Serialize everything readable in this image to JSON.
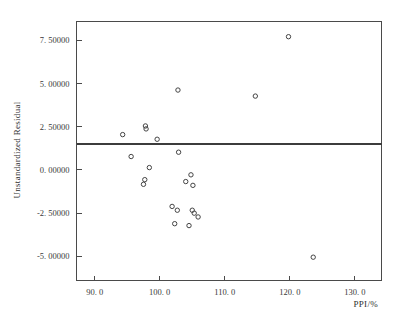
{
  "chart_data": {
    "type": "scatter",
    "title": "",
    "xlabel": "PPI/%",
    "ylabel": "Unstandardized Residual",
    "xlim": [
      87.2,
      134.1
    ],
    "ylim": [
      -6.4,
      8.6
    ],
    "grid": false,
    "legend": null,
    "marker": "open-circle",
    "xticks": [
      90.0,
      100.0,
      110.0,
      120.0,
      130.0
    ],
    "xtick_labels": [
      "90. 0",
      "100. 0",
      "110. 0",
      "120. 0",
      "130. 0"
    ],
    "yticks": [
      -5.0,
      -2.5,
      0.0,
      2.5,
      5.0,
      7.5
    ],
    "ytick_labels": [
      "-5. 00000",
      "-2. 50000",
      "0. 00000",
      "2. 50000",
      "5. 00000",
      "7. 50000"
    ],
    "reference_line": {
      "orientation": "horizontal",
      "y": 1.5
    },
    "points": [
      {
        "x": 94.3,
        "y": 2.05
      },
      {
        "x": 97.8,
        "y": 2.55
      },
      {
        "x": 97.9,
        "y": 2.38
      },
      {
        "x": 99.6,
        "y": 1.78
      },
      {
        "x": 95.6,
        "y": 0.78
      },
      {
        "x": 98.4,
        "y": 0.14
      },
      {
        "x": 97.7,
        "y": -0.56
      },
      {
        "x": 97.5,
        "y": -0.83
      },
      {
        "x": 102.8,
        "y": 4.63
      },
      {
        "x": 102.9,
        "y": 1.03
      },
      {
        "x": 104.8,
        "y": -0.28
      },
      {
        "x": 104.0,
        "y": -0.67
      },
      {
        "x": 105.1,
        "y": -0.89
      },
      {
        "x": 101.9,
        "y": -2.11
      },
      {
        "x": 102.7,
        "y": -2.33
      },
      {
        "x": 105.0,
        "y": -2.33
      },
      {
        "x": 105.3,
        "y": -2.5
      },
      {
        "x": 105.9,
        "y": -2.72
      },
      {
        "x": 102.3,
        "y": -3.11
      },
      {
        "x": 104.5,
        "y": -3.22
      },
      {
        "x": 114.7,
        "y": 4.28
      },
      {
        "x": 119.8,
        "y": 7.72
      },
      {
        "x": 123.6,
        "y": -5.05
      }
    ]
  },
  "figure": {
    "background": "#ffffff",
    "axis_color": "#4a4a4a",
    "marker_color": "#444444",
    "reference_line_color": "#3c3c3c"
  }
}
